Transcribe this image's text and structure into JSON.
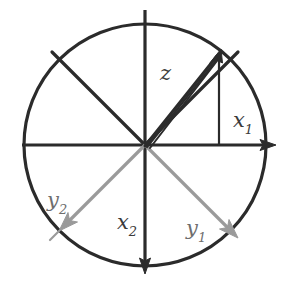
{
  "figure": {
    "kind": "vector-diagram",
    "background_color": "#ffffff",
    "stroke_dark": "#2b2b2b",
    "stroke_gray": "#9a9a9a",
    "label_color": "#3b3b3b",
    "label_color_gray": "#6e6e6e"
  },
  "geometry": {
    "center": {
      "x": 145,
      "y": 145
    },
    "radius": 121,
    "circle_stroke_width": 3,
    "axis_stroke_width": 3,
    "ray_stroke_width": 3,
    "gray_stroke_width": 3,
    "dropline_stroke_width": 2
  },
  "axes": [
    {
      "name": "x1-axis",
      "label": "x",
      "subscript": "1",
      "direction": "right",
      "arrow": true,
      "color": "#2b2b2b",
      "from": {
        "x": 22,
        "y": 145
      },
      "to": {
        "x": 276,
        "y": 145
      }
    },
    {
      "name": "x2-axis",
      "label": "x",
      "subscript": "2",
      "direction": "down",
      "arrow": true,
      "color": "#2b2b2b",
      "from": {
        "x": 145,
        "y": 10
      },
      "to": {
        "x": 145,
        "y": 274
      }
    },
    {
      "name": "y1-axis",
      "label": "y",
      "subscript": "1",
      "direction": "down-right",
      "angle_deg": -45,
      "arrow": true,
      "color": "#9a9a9a",
      "from": {
        "x": 145,
        "y": 145
      },
      "to": {
        "x": 236,
        "y": 236
      }
    },
    {
      "name": "y2-axis",
      "label": "y",
      "subscript": "2",
      "direction": "down-left",
      "angle_deg": -135,
      "arrow": true,
      "color": "#9a9a9a",
      "from": {
        "x": 145,
        "y": 145
      },
      "to": {
        "x": 60,
        "y": 230
      }
    }
  ],
  "rays": [
    {
      "name": "upper-right-ray",
      "angle_deg": 45,
      "color": "#2b2b2b",
      "tick_at_circle": true,
      "from": {
        "x": 145,
        "y": 145
      },
      "to": {
        "x": 232,
        "y": 58
      }
    },
    {
      "name": "upper-left-ray",
      "angle_deg": 135,
      "color": "#2b2b2b",
      "tick_at_circle": true,
      "from": {
        "x": 145,
        "y": 145
      },
      "to": {
        "x": 58,
        "y": 58
      }
    }
  ],
  "vector": {
    "name": "z",
    "label": "z",
    "subscript": "",
    "color": "#2b2b2b",
    "arrow": true,
    "double_stroke": true,
    "angle_deg": 52,
    "from": {
      "x": 145,
      "y": 145
    },
    "to": {
      "x": 218,
      "y": 52
    }
  },
  "dropline": {
    "name": "z-projection-dropline",
    "color": "#2b2b2b",
    "from": {
      "x": 218,
      "y": 55
    },
    "to": {
      "x": 218,
      "y": 145
    }
  },
  "labels": {
    "z": {
      "base": "z",
      "sub": ""
    },
    "x1": {
      "base": "x",
      "sub": "1"
    },
    "x2": {
      "base": "x",
      "sub": "2"
    },
    "y1": {
      "base": "y",
      "sub": "1"
    },
    "y2": {
      "base": "y",
      "sub": "2"
    }
  }
}
